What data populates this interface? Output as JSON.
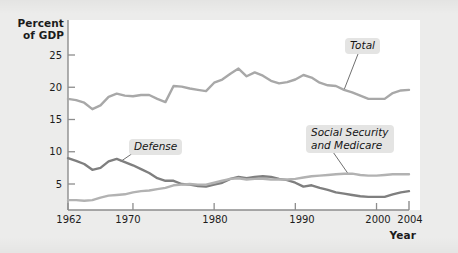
{
  "chart_data": {
    "type": "line",
    "title": "",
    "xlabel": "Year",
    "ylabel": "Percent\nof GDP",
    "xlim": [
      1962,
      2004
    ],
    "ylim": [
      0,
      27
    ],
    "xticks": [
      1962,
      1970,
      1980,
      1990,
      2000,
      2004
    ],
    "yticks": [
      5,
      10,
      15,
      20,
      25
    ],
    "grid": false,
    "legend_position": "inline-annotations",
    "x": [
      1962,
      1963,
      1964,
      1965,
      1966,
      1967,
      1968,
      1969,
      1970,
      1971,
      1972,
      1973,
      1974,
      1975,
      1976,
      1977,
      1978,
      1979,
      1980,
      1981,
      1982,
      1983,
      1984,
      1985,
      1986,
      1987,
      1988,
      1989,
      1990,
      1991,
      1992,
      1993,
      1994,
      1995,
      1996,
      1997,
      1998,
      1999,
      2000,
      2001,
      2002,
      2003,
      2004
    ],
    "series": [
      {
        "name": "Total",
        "color": "#a8a8a8",
        "values": [
          18.2,
          18.0,
          17.6,
          16.6,
          17.2,
          18.5,
          19.0,
          18.7,
          18.6,
          18.8,
          18.8,
          18.2,
          17.7,
          20.2,
          20.1,
          19.8,
          19.6,
          19.4,
          20.7,
          21.2,
          22.1,
          22.9,
          21.7,
          22.3,
          21.8,
          21.0,
          20.6,
          20.8,
          21.2,
          21.9,
          21.5,
          20.7,
          20.3,
          20.2,
          19.6,
          19.2,
          18.7,
          18.2,
          18.2,
          18.2,
          19.1,
          19.5,
          19.6
        ]
      },
      {
        "name": "Defense",
        "color": "#7f7f7f",
        "values": [
          9.0,
          8.6,
          8.1,
          7.2,
          7.5,
          8.5,
          8.9,
          8.4,
          7.9,
          7.3,
          6.7,
          5.9,
          5.5,
          5.5,
          5.0,
          4.9,
          4.7,
          4.6,
          4.9,
          5.2,
          5.8,
          6.1,
          5.9,
          6.1,
          6.2,
          6.1,
          5.8,
          5.6,
          5.2,
          4.6,
          4.8,
          4.4,
          4.1,
          3.7,
          3.5,
          3.3,
          3.1,
          3.0,
          3.0,
          3.0,
          3.4,
          3.7,
          3.9
        ]
      },
      {
        "name": "Social Security and Medicare",
        "color": "#b2b2b2",
        "values": [
          2.5,
          2.5,
          2.4,
          2.5,
          2.9,
          3.2,
          3.3,
          3.4,
          3.7,
          3.9,
          4.0,
          4.2,
          4.4,
          4.8,
          4.9,
          5.0,
          4.9,
          4.9,
          5.2,
          5.5,
          5.8,
          5.9,
          5.7,
          5.8,
          5.8,
          5.7,
          5.7,
          5.7,
          5.8,
          6.0,
          6.2,
          6.3,
          6.4,
          6.5,
          6.6,
          6.6,
          6.4,
          6.3,
          6.3,
          6.4,
          6.5,
          6.5,
          6.5
        ]
      }
    ],
    "annotations": [
      {
        "name": "Total",
        "text": "Total"
      },
      {
        "name": "Defense",
        "text": "Defense"
      },
      {
        "name": "Social Security and Medicare",
        "text": "Social Security\nand Medicare"
      }
    ]
  },
  "axis": {
    "ylabel": "Percent\nof GDP",
    "xlabel": "Year",
    "yticks": [
      "25",
      "20",
      "15",
      "10",
      "5"
    ],
    "xticks": [
      "1962",
      "1970",
      "1980",
      "1990",
      "2000",
      "2004"
    ]
  },
  "labels": {
    "total": "Total",
    "defense": "Defense",
    "social_security_medicare": "Social Security\nand Medicare"
  },
  "colors": {
    "total_line": "#a8a8a8",
    "defense_line": "#7f7f7f",
    "ssm_line": "#b2b2b2",
    "axis": "#8d8d8d",
    "plot_background": "#ffffff",
    "page_background": "#ececeb",
    "callout_background": "#e4e4e3"
  }
}
